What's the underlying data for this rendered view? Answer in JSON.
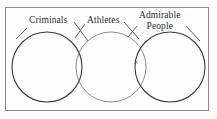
{
  "figure": {
    "kind": "three-set-venn-diagram",
    "frame": {
      "stroke_color": "#8a8a8a"
    },
    "background_color": "#fefefe"
  },
  "labels": {
    "criminals": "Criminals",
    "athletes": "Athletes",
    "admirable_line1": "Admirable",
    "admirable_line2": "People"
  },
  "element_markers": {
    "x_mark": "×"
  },
  "chart_data": {
    "type": "venn",
    "title": "",
    "sets": [
      {
        "name": "Criminals",
        "label_lines": [
          "Criminals"
        ],
        "cx": 47,
        "cy": 67,
        "r": 35,
        "stroke": "#3a3a3a",
        "stroke_width": 1.1
      },
      {
        "name": "Athletes",
        "label_lines": [
          "Athletes"
        ],
        "cx": 111,
        "cy": 67,
        "r": 35,
        "stroke": "#8d8d8d",
        "stroke_width": 1.0
      },
      {
        "name": "Admirable People",
        "label_lines": [
          "Admirable",
          "People"
        ],
        "cx": 170,
        "cy": 67,
        "r": 35,
        "stroke": "#3a3a3a",
        "stroke_width": 1.1
      }
    ],
    "regions_marked": [
      {
        "region": "Athletes ∩ Admirable People (not Criminals)",
        "marker": "×",
        "x": 136,
        "y": 63
      }
    ],
    "leader_lines": [
      {
        "for": "Criminals",
        "x1": 27,
        "y1": 28,
        "x2": 17,
        "y2": 38
      },
      {
        "for": "Criminals",
        "x1": 74,
        "y1": 22,
        "x2": 88,
        "y2": 40
      },
      {
        "for": "Athletes",
        "x1": 85,
        "y1": 24,
        "x2": 76,
        "y2": 37
      },
      {
        "for": "Athletes",
        "x1": 124,
        "y1": 22,
        "x2": 138,
        "y2": 38
      },
      {
        "for": "Admirable People",
        "x1": 137,
        "y1": 25,
        "x2": 129,
        "y2": 36
      },
      {
        "for": "Admirable People",
        "x1": 186,
        "y1": 25,
        "x2": 199,
        "y2": 40
      }
    ]
  }
}
